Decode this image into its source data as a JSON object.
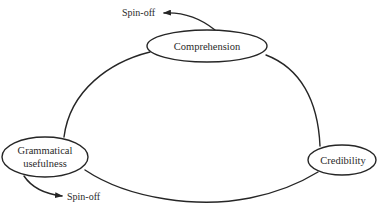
{
  "diagram": {
    "nodes": {
      "comprehension": {
        "label": "Comprehension"
      },
      "grammatical": {
        "line1": "Grammatical",
        "line2": "usefulness"
      },
      "credibility": {
        "label": "Credibility"
      }
    },
    "spinoffs": {
      "top": {
        "label": "Spin-off"
      },
      "bottom": {
        "label": "Spin-off"
      }
    },
    "colors": {
      "stroke": "#262626",
      "text": "#2a2a2a",
      "background": "#ffffff"
    }
  }
}
